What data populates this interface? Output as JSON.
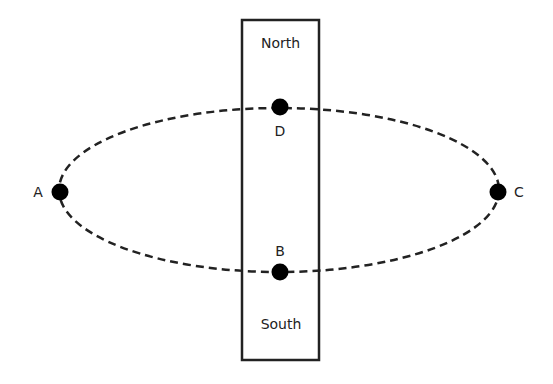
{
  "diagram": {
    "box": {
      "top_label": "North",
      "bottom_label": "South"
    },
    "orbit": {
      "style": "dashed",
      "shape": "ellipse"
    },
    "points": [
      {
        "id": "A",
        "label": "A"
      },
      {
        "id": "B",
        "label": "B"
      },
      {
        "id": "C",
        "label": "C"
      },
      {
        "id": "D",
        "label": "D"
      }
    ],
    "colors": {
      "stroke": "#222222",
      "point_fill": "#000000",
      "background": "#ffffff"
    }
  }
}
